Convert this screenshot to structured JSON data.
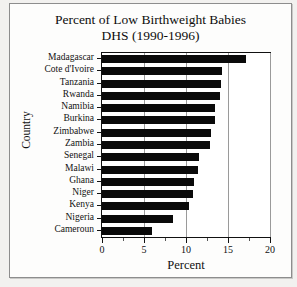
{
  "figure": {
    "title_line1": "Percent of Low Birthweight Babies",
    "title_line2": "DHS (1990-1996)",
    "axis_color": "#111111",
    "bar_color": "#0a0a0a",
    "background": "#ffffff"
  },
  "chart_data": {
    "type": "bar",
    "orientation": "horizontal",
    "title": "Percent of Low Birthweight Babies DHS (1990-1996)",
    "xlabel": "Percent",
    "ylabel": "Country",
    "categories": [
      "Madagascar",
      "Cote d'Ivoire",
      "Tanzania",
      "Rwanda",
      "Namibia",
      "Burkina",
      "Zimbabwe",
      "Zambia",
      "Senegal",
      "Malawi",
      "Ghana",
      "Niger",
      "Kenya",
      "Nigeria",
      "Cameroun"
    ],
    "values": [
      17.2,
      14.3,
      14.2,
      14.0,
      13.5,
      13.4,
      13.0,
      12.8,
      11.5,
      11.4,
      11.0,
      10.8,
      10.4,
      8.5,
      6.0
    ],
    "xlim": [
      0,
      20
    ],
    "xticks": [
      0,
      5,
      10,
      15,
      20
    ],
    "xtick_labels": [
      "0",
      "5",
      "10",
      "15",
      "20"
    ],
    "grid": "vertical",
    "legend": null
  }
}
